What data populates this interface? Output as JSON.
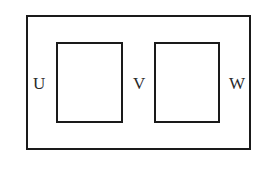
{
  "diagram": {
    "type": "region-diagram",
    "outer_region": {
      "label": ""
    },
    "inner_regions": [
      {
        "id": "left-box"
      },
      {
        "id": "right-box"
      }
    ],
    "labels": {
      "u": "U",
      "v": "V",
      "w": "W"
    },
    "colors": {
      "stroke": "#1a1a1a",
      "text": "#2a2a2a",
      "background": "#ffffff"
    }
  }
}
